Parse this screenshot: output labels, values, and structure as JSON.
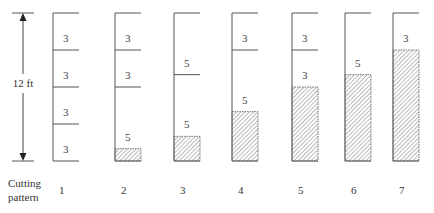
{
  "dimension": {
    "label": "12 ft",
    "total_ft": 12
  },
  "row_label": {
    "line1": "Cutting",
    "line2": "pattern"
  },
  "geometry": {
    "top_y": 13,
    "bottom_y": 161,
    "bar_width": 26,
    "arrow_x": 23
  },
  "colors": {
    "line": "#555555",
    "hatch": "#666666"
  },
  "patterns": [
    {
      "id": "1",
      "x": 53,
      "waste_ft": 0,
      "pieces": [
        3,
        3,
        3,
        3
      ]
    },
    {
      "id": "2",
      "x": 115,
      "waste_ft": 1,
      "pieces": [
        5,
        3,
        3
      ]
    },
    {
      "id": "3",
      "x": 174,
      "waste_ft": 2,
      "pieces": [
        5,
        5
      ]
    },
    {
      "id": "4",
      "x": 232,
      "waste_ft": 4,
      "pieces": [
        5,
        3
      ]
    },
    {
      "id": "5",
      "x": 292,
      "waste_ft": 6,
      "pieces": [
        3,
        3
      ]
    },
    {
      "id": "6",
      "x": 345,
      "waste_ft": 7,
      "pieces": [
        5
      ]
    },
    {
      "id": "7",
      "x": 393,
      "waste_ft": 9,
      "pieces": [
        3
      ]
    }
  ]
}
